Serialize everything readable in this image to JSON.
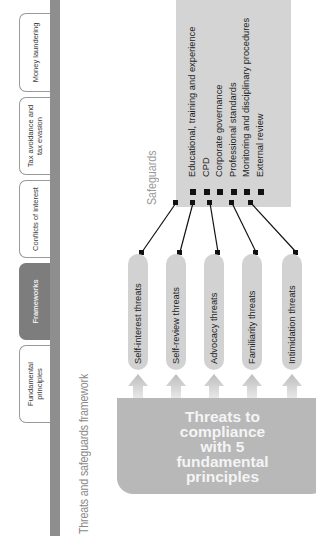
{
  "tabs": [
    {
      "label": "Fundamental principles",
      "active": false
    },
    {
      "label": "Frameworks",
      "active": true
    },
    {
      "label": "Conflicts of interest",
      "active": false
    },
    {
      "label": "Tax avoidance and tax evasion",
      "active": false
    },
    {
      "label": "Money laundering",
      "active": false
    }
  ],
  "title": "Threats and safeguards framework",
  "safeguards": {
    "heading": "Safeguards",
    "items": [
      "Educational, training and experience",
      "CPD",
      "Corporate governance",
      "Professional standards",
      "Monitoring and disciplinary procedures",
      "External review"
    ]
  },
  "threats": [
    "Self-interest threats",
    "Self-review threats",
    "Advocacy threats",
    "Familiarity threats",
    "Intimidation threats"
  ],
  "source_box": {
    "text": "Threats to compliance with 5 fundamental principles"
  },
  "colors": {
    "active_tab": "#7d7d7d",
    "bar": "#8e8e8e",
    "safeguards_box": "#d4d4d4",
    "threat_pill": "#d2d2d2",
    "source_box": "#b8b8b8"
  }
}
